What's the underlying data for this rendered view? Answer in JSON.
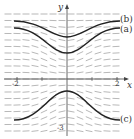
{
  "figure": {
    "type": "slope-field",
    "axes": {
      "x_label": "x",
      "y_label": "y",
      "x_ticks": [
        {
          "value": -2,
          "label": "-2"
        },
        {
          "value": 2,
          "label": "2"
        }
      ],
      "y_ticks": [
        {
          "value": -3,
          "label": "-3"
        }
      ]
    },
    "curves": [
      {
        "id": "a",
        "label": "(a)"
      },
      {
        "id": "b",
        "label": "(b)"
      },
      {
        "id": "c",
        "label": "(c)"
      }
    ],
    "colors": {
      "field": "#888888",
      "curve": "#222222",
      "axis": "#444444"
    }
  }
}
